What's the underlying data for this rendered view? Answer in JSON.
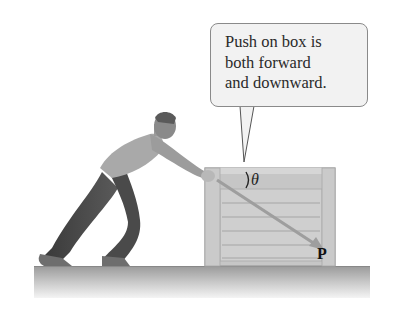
{
  "figure": {
    "callout": {
      "lines": [
        "Push on box is",
        "both forward",
        "and downward."
      ]
    },
    "labels": {
      "angle": "θ",
      "force_vector": "P"
    },
    "colors": {
      "background": "#ffffff",
      "callout_fill": "#f2f2f2",
      "callout_border": "#8a8a8a",
      "crate": "#c9c9c9",
      "crate_plank": "#a8a8a8",
      "floor_top": "#9c9c9c",
      "floor_bottom": "#f0f0f0",
      "arrow": "#9a9a9a"
    }
  }
}
